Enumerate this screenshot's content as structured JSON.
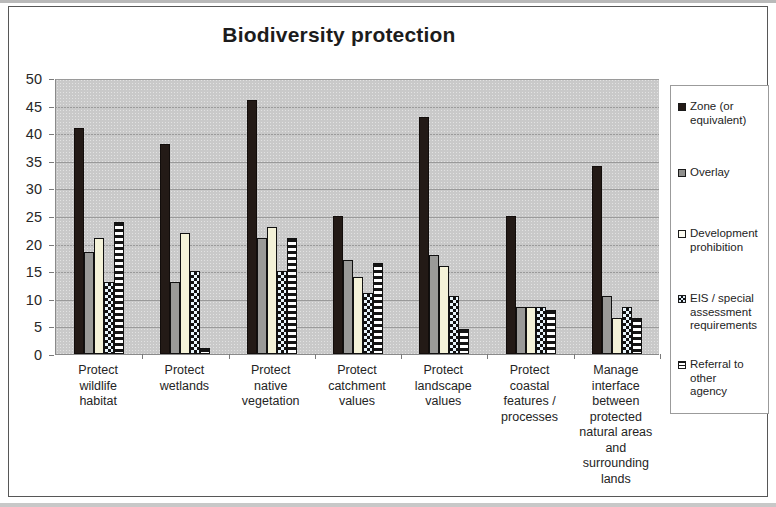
{
  "chart_data": {
    "type": "bar",
    "title": "Biodiversity protection",
    "xlabel": "",
    "ylabel": "",
    "ylim": [
      0,
      50
    ],
    "ytick_step": 5,
    "yticks": [
      "50",
      "45",
      "40",
      "35",
      "30",
      "25",
      "20",
      "15",
      "10",
      "5",
      "0"
    ],
    "grid": true,
    "legend_position": "right",
    "plot_background": "#c9c9c9",
    "categories": [
      "Protect wildlife habitat",
      "Protect wetlands",
      "Protect native vegetation",
      "Protect catchment values",
      "Protect landscape values",
      "Protect coastal features / processes",
      "Manage interface between protected natural areas and surrounding lands"
    ],
    "category_lines": [
      [
        "Protect",
        "wildlife",
        "habitat"
      ],
      [
        "Protect",
        "wetlands"
      ],
      [
        "Protect",
        "native",
        "vegetation"
      ],
      [
        "Protect",
        "catchment",
        "values"
      ],
      [
        "Protect",
        "landscape",
        "values"
      ],
      [
        "Protect",
        "coastal",
        "features /",
        "processes"
      ],
      [
        "Manage",
        "interface",
        "between",
        "protected",
        "natural areas",
        "and",
        "surrounding",
        "lands"
      ]
    ],
    "series": [
      {
        "name": "Zone (or equivalent)",
        "legend_lines": [
          "Zone (or",
          "equivalent)"
        ],
        "pattern": "solid-black",
        "color": "#231a16",
        "values": [
          41,
          38,
          46,
          25,
          43,
          25,
          34
        ]
      },
      {
        "name": "Overlay",
        "legend_lines": [
          "Overlay"
        ],
        "pattern": "solid-gray",
        "color": "#9a9a98",
        "values": [
          18.5,
          13,
          21,
          17,
          18,
          8.5,
          10.5
        ]
      },
      {
        "name": "Development prohibition",
        "legend_lines": [
          "Development",
          "prohibition"
        ],
        "pattern": "solid-cream",
        "color": "#f4f2d8",
        "values": [
          21,
          22,
          23,
          14,
          16,
          8.5,
          6.5
        ]
      },
      {
        "name": "EIS / special assessment requirements",
        "legend_lines": [
          "EIS / special",
          "assessment",
          "requirements"
        ],
        "pattern": "checkerboard",
        "color": "#e8f4fb",
        "values": [
          13,
          15,
          15,
          11,
          10.5,
          8.5,
          8.5
        ]
      },
      {
        "name": "Referral to other agency",
        "legend_lines": [
          "Referral to other",
          "agency"
        ],
        "pattern": "horizontal-stripes",
        "color": "#ffffff",
        "values": [
          24,
          1,
          21,
          16.5,
          4.5,
          8,
          6.5
        ]
      }
    ]
  }
}
